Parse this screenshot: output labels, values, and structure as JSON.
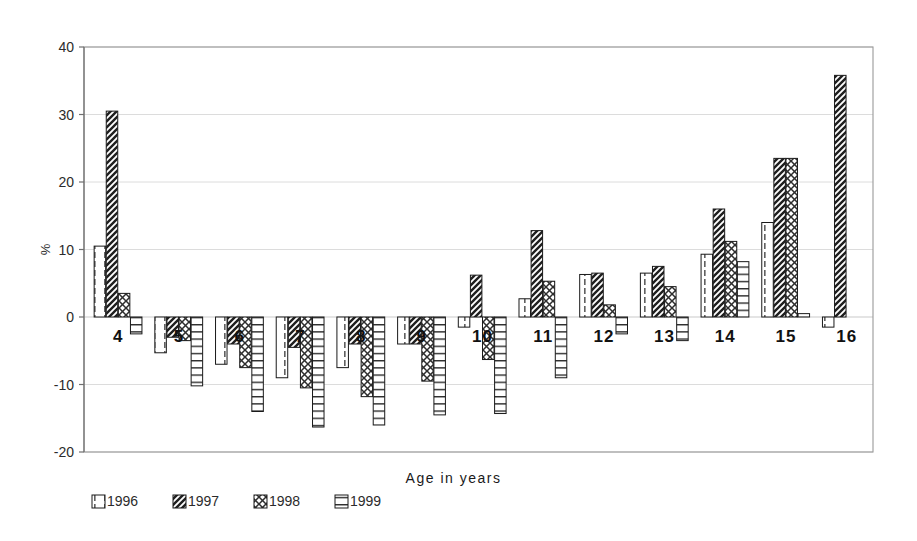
{
  "chart_data": {
    "type": "bar",
    "title": "",
    "xlabel": "Age in years",
    "ylabel": "%",
    "ylim": [
      -20,
      40
    ],
    "yticks": [
      40,
      30,
      20,
      10,
      0,
      -10,
      -20
    ],
    "ytick_labels": [
      "40",
      "30",
      "20",
      "10",
      "0",
      "-10",
      "-20"
    ],
    "grid": true,
    "legend_position": "bottom-left",
    "categories": [
      "4",
      "5",
      "6",
      "7",
      "8",
      "9",
      "10",
      "11",
      "12",
      "13",
      "14",
      "15",
      "16"
    ],
    "series": [
      {
        "name": "1996",
        "pattern": "vertical-dash",
        "values": [
          10.5,
          -5.3,
          -7.0,
          -9.0,
          -7.5,
          -4.0,
          -1.5,
          2.7,
          6.3,
          6.5,
          9.3,
          14.0,
          -1.5
        ]
      },
      {
        "name": "1997",
        "pattern": "diagonal-hatch",
        "values": [
          30.5,
          -3.0,
          -4.0,
          -4.5,
          -4.0,
          -4.0,
          6.2,
          12.8,
          6.5,
          7.5,
          16.0,
          23.5,
          35.8
        ]
      },
      {
        "name": "1998",
        "pattern": "cross-hatch",
        "values": [
          3.5,
          -3.5,
          -7.5,
          -10.5,
          -11.8,
          -9.5,
          -6.3,
          5.3,
          1.8,
          4.5,
          11.2,
          23.5,
          0
        ]
      },
      {
        "name": "1999",
        "pattern": "horizontal-lines",
        "values": [
          -2.5,
          -10.2,
          -14.0,
          -16.3,
          -16.0,
          -14.5,
          -14.3,
          -9.0,
          -2.5,
          -3.5,
          8.2,
          0.5,
          0
        ]
      }
    ]
  },
  "legend": {
    "items": [
      {
        "label": "1996",
        "pattern": "vertical-dash"
      },
      {
        "label": "1997",
        "pattern": "diagonal-hatch"
      },
      {
        "label": "1998",
        "pattern": "cross-hatch"
      },
      {
        "label": "1999",
        "pattern": "horizontal-lines"
      }
    ]
  },
  "colors": {
    "plot_border": "#9a9a9a",
    "gridline": "#dcdcdc",
    "bar_outline": "#1a1a1a",
    "bar_fill": "#ffffff",
    "pattern_stroke": "#2b2b2b",
    "text": "#1a1a1a"
  }
}
